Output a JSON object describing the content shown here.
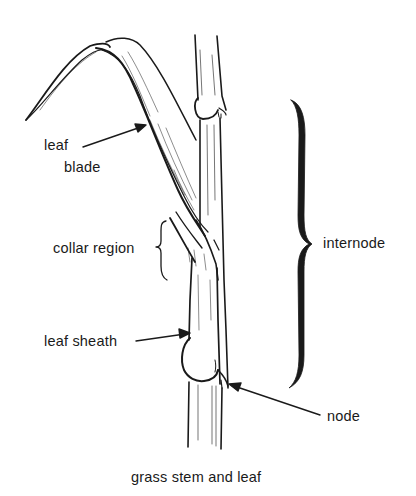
{
  "diagram": {
    "caption": "grass stem and leaf",
    "colors": {
      "background": "#ffffff",
      "ink": "#1a1a1a"
    },
    "labels": {
      "leaf_blade_line1": "leaf",
      "leaf_blade_line2": "blade",
      "collar_region": "collar region",
      "leaf_sheath": "leaf sheath",
      "internode": "internode",
      "node": "node"
    },
    "parts": [
      {
        "name": "leaf blade",
        "pointer": "arrow"
      },
      {
        "name": "collar region",
        "pointer": "brace"
      },
      {
        "name": "leaf sheath",
        "pointer": "arrow"
      },
      {
        "name": "internode",
        "pointer": "brace"
      },
      {
        "name": "node",
        "pointer": "arrow"
      }
    ]
  }
}
